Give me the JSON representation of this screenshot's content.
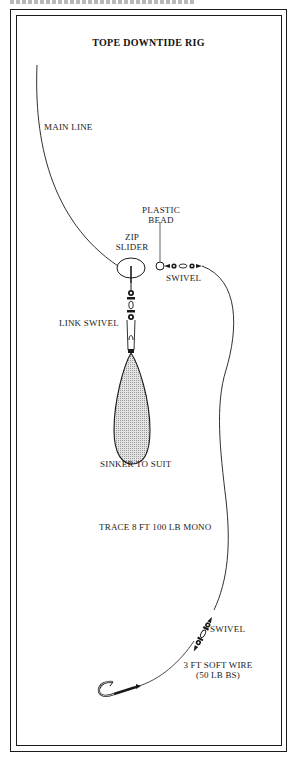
{
  "diagram": {
    "title": "TOPE DOWNTIDE RIG",
    "labels": {
      "main_line": "MAIN LINE",
      "plastic_bead_line1": "PLASTIC",
      "plastic_bead_line2": "BEAD",
      "zip_slider_line1": "ZIP",
      "zip_slider_line2": "SLIDER",
      "swivel_top": "SWIVEL",
      "link_swivel": "LINK SWIVEL",
      "sinker": "SINKER TO SUIT",
      "trace": "TRACE 8 FT 100 LB MONO",
      "swivel_bottom": "SWIVEL",
      "wire_line1": "3 FT SOFT WIRE",
      "wire_line2": "(50 LB BS)"
    },
    "components": [
      "main-line",
      "zip-slider",
      "plastic-bead",
      "swivel",
      "link-swivel",
      "sinker",
      "trace",
      "swivel",
      "soft-wire",
      "hook"
    ],
    "colors": {
      "ink": "#1a1a1a",
      "sinker_fill": "#c8c8c8"
    }
  }
}
